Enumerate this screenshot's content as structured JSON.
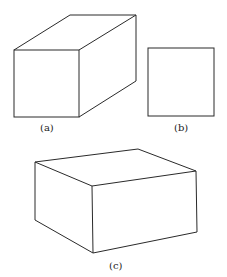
{
  "figures": [
    {
      "id": "a",
      "label": "(a)",
      "description": "rectangular box in oblique view"
    },
    {
      "id": "b",
      "label": "(b)",
      "description": "square front view"
    },
    {
      "id": "c",
      "label": "(c)",
      "description": "box in two-point perspective"
    }
  ],
  "colors": {
    "stroke": "#2a2a2a",
    "background": "#ffffff"
  }
}
